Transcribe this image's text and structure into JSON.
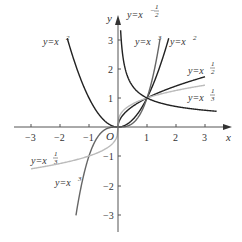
{
  "chart_data": {
    "type": "line",
    "title": "",
    "xlabel": "x",
    "ylabel": "y",
    "origin_label": "O",
    "xlim": [
      -3.3,
      3.5
    ],
    "ylim": [
      -3.2,
      3.4
    ],
    "grid": false,
    "x_ticks": [
      -3,
      -2,
      -1,
      1,
      2,
      3
    ],
    "y_ticks": [
      -3,
      -2,
      -1,
      1,
      2,
      3
    ],
    "x_tick_labels": [
      "−3",
      "−2",
      "−1",
      "1",
      "2",
      "3"
    ],
    "y_tick_labels": [
      "−3",
      "−2",
      "−1",
      "1",
      "2",
      "3"
    ],
    "series": [
      {
        "name": "y=x^2",
        "label_base": "y=x",
        "label_exp": "2",
        "color": "#222222",
        "domain": [
          -1.75,
          1.75
        ],
        "exponent": 2
      },
      {
        "name": "y=x^3",
        "label_base": "y=x",
        "label_exp": "3",
        "color": "#666666",
        "domain": [
          -1.45,
          1.45
        ],
        "exponent": 3
      },
      {
        "name": "y=x^(1/2)",
        "label_base": "y=x",
        "label_exp": "1/2",
        "color": "#222222",
        "domain": [
          0,
          3
        ],
        "exponent": 0.5
      },
      {
        "name": "y=x^(1/3)",
        "label_base": "y=x",
        "label_exp": "1/3",
        "color": "#bbbbbb",
        "domain": [
          -3,
          3
        ],
        "exponent": 0.3333
      },
      {
        "name": "y=x^(-1/2)",
        "label_base": "y=x",
        "label_exp": "−1/2",
        "color": "#222222",
        "domain": [
          0.09,
          3.4
        ],
        "exponent": -0.5
      }
    ],
    "annotations": [
      {
        "text": "y=x²",
        "position": "upper-left, near (-1.7, 3)"
      },
      {
        "text": "y=x^(-1/2)",
        "position": "top, near (0.3, 3.3)"
      },
      {
        "text": "y=x³",
        "position": "top, near (1.1, 2.8)"
      },
      {
        "text": "y=x²",
        "position": "top, near (2.2, 2.8)"
      },
      {
        "text": "y=x^(1/2)",
        "position": "right, near (2.6, 1.7)"
      },
      {
        "text": "y=x^(1/3)",
        "position": "right, near (2.6, 0.9)"
      },
      {
        "text": "y=x^(1/3)",
        "position": "left, near (-2.6, -1.0)"
      },
      {
        "text": "y=x³",
        "position": "lower-left, near (-1.2, -2.3)"
      }
    ]
  },
  "labels": {
    "x_axis": "x",
    "y_axis": "y",
    "origin": "O",
    "curve_base": "y=x",
    "exp_2": "2",
    "exp_3": "3",
    "exp_half_num": "1",
    "exp_half_den": "2",
    "exp_third_num": "1",
    "exp_third_den": "3",
    "exp_neg": "−",
    "ticks": {
      "xm3": "−3",
      "xm2": "−2",
      "xm1": "−1",
      "x1": "1",
      "x2": "2",
      "x3": "3",
      "ym3": "−3",
      "ym2": "−2",
      "ym1": "−1",
      "y1": "1",
      "y2": "2",
      "y3": "3"
    }
  }
}
